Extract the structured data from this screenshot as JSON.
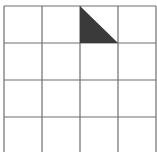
{
  "figure": {
    "grid": {
      "rows": 4,
      "cols": 4,
      "line_color": "#6e6e6e",
      "background": "#ffffff",
      "x_lines": [
        4,
        42,
        80,
        118,
        156
      ],
      "y_lines": [
        6,
        43,
        80,
        117,
        152
      ]
    },
    "shaded_shapes": [
      {
        "type": "right-triangle",
        "cell": {
          "row": 0,
          "col": 2
        },
        "vertices": "80,6 80,43 118,43",
        "fill": "#3a3a3a"
      }
    ]
  }
}
